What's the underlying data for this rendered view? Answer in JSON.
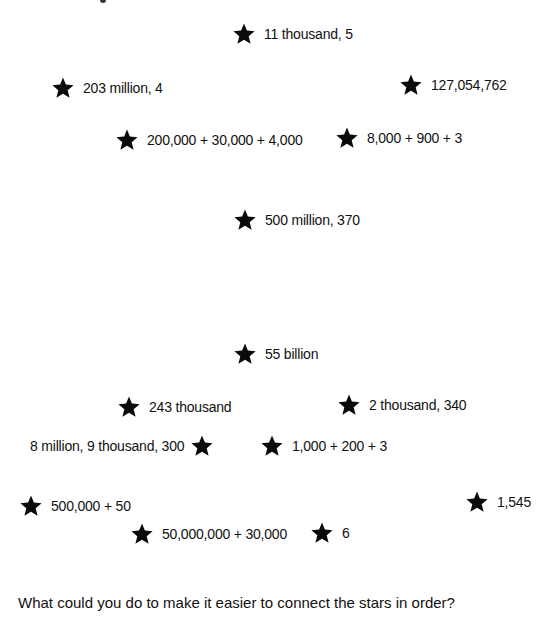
{
  "stars": [
    {
      "label": "11 thousand, 5"
    },
    {
      "label": "203 million, 4"
    },
    {
      "label": "127,054,762"
    },
    {
      "label": "200,000 + 30,000 + 4,000"
    },
    {
      "label": "8,000 + 900 + 3"
    },
    {
      "label": "500 million, 370"
    },
    {
      "label": "55 billion"
    },
    {
      "label": "243 thousand"
    },
    {
      "label": "2 thousand, 340"
    },
    {
      "label": "8 million, 9 thousand, 300"
    },
    {
      "label": "1,000 + 200 + 3"
    },
    {
      "label": "500,000 + 50"
    },
    {
      "label": "1,545"
    },
    {
      "label": "50,000,000 + 30,000"
    },
    {
      "label": "6"
    }
  ],
  "question": "What could you do to make it easier to connect the stars in order?"
}
